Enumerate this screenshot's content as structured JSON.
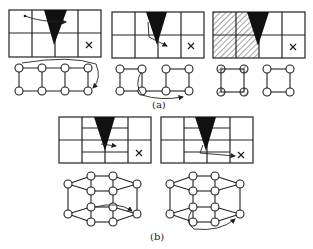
{
  "figure": {
    "captions": {
      "a": "(a)",
      "b": "(b)"
    },
    "panel_a": [
      {
        "id": "a1",
        "description": "2x4 grid with wedge; arrow moves across top row; ring graph with wraparound arrow",
        "target": "×"
      },
      {
        "id": "a2",
        "description": "2x4 grid with wedge; arrow goes down-right; graph split into two squares with arrow between",
        "target": "×"
      },
      {
        "id": "a3",
        "description": "2x4 grid with hatched left cells; two separate square graphs, left one hatched",
        "target": "×"
      }
    ],
    "panel_b": [
      {
        "id": "b1",
        "description": "grid with subdivided middle columns; small arrow right; 3D prism graph with arrow",
        "target": "×"
      },
      {
        "id": "b2",
        "description": "grid with subdivided middle columns; long arrow to target; 3D prism graph with curved arrow",
        "target": "×"
      }
    ],
    "colors": {
      "line": "#222222",
      "wedge": "#111111",
      "node_fill": "#ffffff",
      "hatch": "#444444"
    }
  }
}
